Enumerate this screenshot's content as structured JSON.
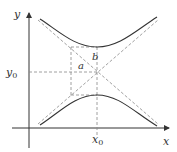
{
  "diagram": {
    "labels": {
      "x_axis": "x",
      "y_axis": "y",
      "x0": "x0",
      "y0": "y0",
      "a": "a",
      "b": "b"
    },
    "colors": {
      "curve": "#333333",
      "dashed": "#888888",
      "axis": "#333333"
    }
  }
}
